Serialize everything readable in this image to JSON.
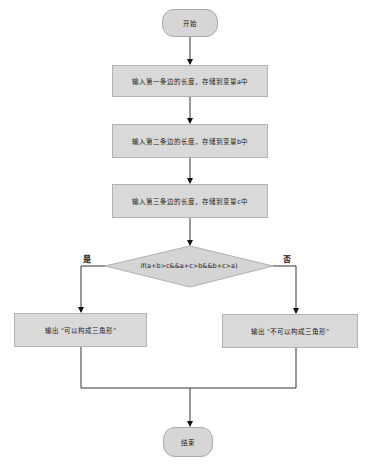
{
  "diagram": {
    "type": "flowchart",
    "colors": {
      "fill": "#d9d9d9",
      "border": "#b3b3b3",
      "connector": "#333333",
      "background": "#ffffff"
    },
    "nodes": {
      "start": {
        "shape": "terminator",
        "label": "开始"
      },
      "input_a": {
        "shape": "process",
        "label": "输入第一条边的长度，存储到变量a中"
      },
      "input_b": {
        "shape": "process",
        "label": "输入第二条边的长度，存储到变量b中"
      },
      "input_c": {
        "shape": "process",
        "label": "输入第三条边的长度，存储到变量c中"
      },
      "decision": {
        "shape": "decision",
        "label": "if(a+b>c&&a+c>b&&b+c>a)"
      },
      "output_yes": {
        "shape": "process",
        "label": "输出 “可以构成三角形”"
      },
      "output_no": {
        "shape": "process",
        "label": "输出 “不可以构成三角形”"
      },
      "end": {
        "shape": "terminator",
        "label": "结束"
      }
    },
    "branch_labels": {
      "yes": "是",
      "no": "否"
    },
    "edges": [
      {
        "from": "start",
        "to": "input_a"
      },
      {
        "from": "input_a",
        "to": "input_b"
      },
      {
        "from": "input_b",
        "to": "input_c"
      },
      {
        "from": "input_c",
        "to": "decision"
      },
      {
        "from": "decision",
        "to": "output_yes",
        "label": "是"
      },
      {
        "from": "decision",
        "to": "output_no",
        "label": "否"
      },
      {
        "from": "output_yes",
        "to": "end"
      },
      {
        "from": "output_no",
        "to": "end"
      }
    ]
  }
}
